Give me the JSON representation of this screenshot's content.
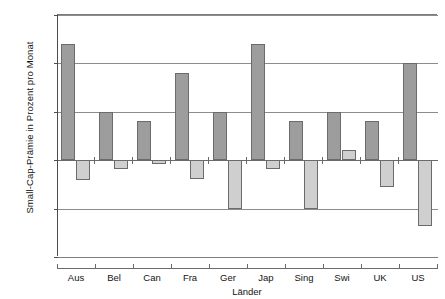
{
  "chart_data": {
    "type": "bar",
    "title": "",
    "subtitle": "",
    "xlabel": "Länder",
    "ylabel": "Small-Cap-Prämie in Prozent pro Monat",
    "categories": [
      "Aus",
      "Bel",
      "Can",
      "Fra",
      "Ger",
      "Jap",
      "Sing",
      "Swi",
      "UK",
      "US"
    ],
    "series": [
      {
        "name": "positive",
        "color": "#9d9d9d",
        "values": [
          1.2,
          0.5,
          0.4,
          0.9,
          0.5,
          1.2,
          0.4,
          0.5,
          0.4,
          1.0
        ]
      },
      {
        "name": "negative",
        "color": "#cfcfcf",
        "values": [
          -0.2,
          -0.09,
          -0.04,
          -0.19,
          -0.5,
          -0.09,
          -0.5,
          0.11,
          -0.28,
          -0.68
        ]
      }
    ],
    "ylim": [
      -1.0,
      1.5
    ],
    "ytick_values": [
      1.5,
      1.0,
      0.5,
      0.0,
      -0.5,
      -1.0
    ],
    "ytick_labels": [
      "1,5%",
      "1,0%",
      "0,5%",
      "0,0%",
      "-0,5%",
      "-1,0%"
    ],
    "grid": true,
    "grid_axis": "y",
    "legend": false,
    "legend_position": "none",
    "unit": "%",
    "decimal_separator": ","
  },
  "colors": {
    "positive_bar": "#9d9d9d",
    "negative_bar": "#cfcfcf",
    "bar_border": "#6b6b6b",
    "gridline": "#8c8c8c",
    "axis": "#4c4c4c",
    "text": "#141414",
    "background": "#ffffff"
  }
}
